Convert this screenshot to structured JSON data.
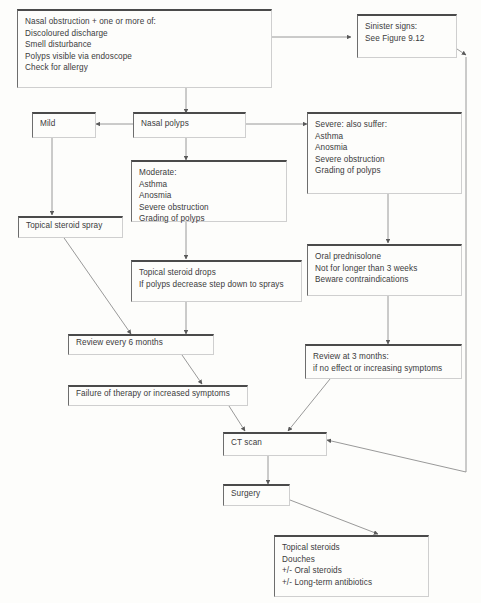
{
  "diagram": {
    "ink_color": "#3b3b3b",
    "rule_color": "#4a4a4a",
    "background": "#fdfdfb"
  },
  "nodes": {
    "presentation": {
      "lines": [
        "Nasal obstruction + one or more of:",
        "Discoloured discharge",
        "Smell disturbance",
        "Polyps visible via endoscope",
        "Check for allergy"
      ]
    },
    "sinister": {
      "lines": [
        "Sinister signs:",
        "See Figure 9.12"
      ]
    },
    "nasal_polyps": {
      "label": "Nasal polyps"
    },
    "mild": {
      "label": "Mild"
    },
    "moderate": {
      "lines": [
        "Moderate:",
        "Asthma",
        "Anosmia",
        "Severe obstruction",
        "Grading of polyps"
      ]
    },
    "severe": {
      "lines": [
        "Severe: also suffer:",
        "Asthma",
        "Anosmia",
        "Severe obstruction",
        "Grading of polyps"
      ]
    },
    "topical_spray": {
      "label": "Topical steroid spray"
    },
    "topical_drops": {
      "lines": [
        "Topical steroid drops",
        "If polyps decrease step down to sprays"
      ]
    },
    "oral_prednisolone": {
      "lines": [
        "Oral prednisolone",
        "Not for longer than 3 weeks",
        "Beware contraindications"
      ]
    },
    "review_6_months": {
      "label": "Review every 6 months"
    },
    "review_3_months": {
      "lines": [
        "Review at 3 months:",
        "if no effect or increasing symptoms"
      ]
    },
    "failure": {
      "label": "Failure of therapy or increased symptoms"
    },
    "ct_scan": {
      "label": "CT scan"
    },
    "surgery": {
      "label": "Surgery"
    },
    "post_op": {
      "lines": [
        "Topical steroids",
        "Douches",
        "+/- Oral steroids",
        "+/- Long-term antibiotics"
      ]
    }
  },
  "edges": [
    {
      "from": "presentation",
      "to": "sinister",
      "kind": "arrow-right"
    },
    {
      "from": "presentation",
      "to": "nasal_polyps",
      "kind": "arrow-down"
    },
    {
      "from": "nasal_polyps",
      "to": "mild",
      "kind": "arrow-left"
    },
    {
      "from": "nasal_polyps",
      "to": "moderate",
      "kind": "arrow-down"
    },
    {
      "from": "nasal_polyps",
      "to": "severe",
      "kind": "arrow-right"
    },
    {
      "from": "mild",
      "to": "topical_spray",
      "kind": "arrow-down"
    },
    {
      "from": "moderate",
      "to": "topical_drops",
      "kind": "arrow-down"
    },
    {
      "from": "severe",
      "to": "oral_prednisolone",
      "kind": "arrow-down"
    },
    {
      "from": "topical_spray",
      "to": "review_6_months",
      "kind": "arrow-diagonal"
    },
    {
      "from": "topical_drops",
      "to": "review_6_months",
      "kind": "arrow-down"
    },
    {
      "from": "oral_prednisolone",
      "to": "review_3_months",
      "kind": "arrow-down"
    },
    {
      "from": "review_6_months",
      "to": "failure",
      "kind": "arrow-diagonal"
    },
    {
      "from": "failure",
      "to": "ct_scan",
      "kind": "arrow-diagonal"
    },
    {
      "from": "review_3_months",
      "to": "ct_scan",
      "kind": "arrow-diagonal"
    },
    {
      "from": "sinister",
      "to": "ct_scan",
      "kind": "arrow-bus-right"
    },
    {
      "from": "ct_scan",
      "to": "surgery",
      "kind": "arrow-down"
    },
    {
      "from": "surgery",
      "to": "post_op",
      "kind": "arrow-diagonal"
    }
  ]
}
